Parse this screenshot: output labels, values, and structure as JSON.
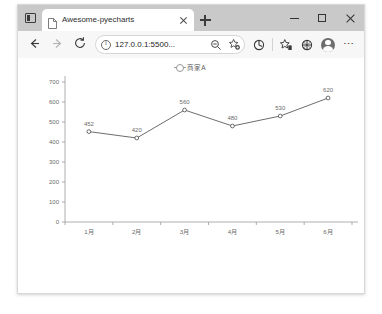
{
  "window": {
    "controls": {
      "minimize_label": "Minimize",
      "maximize_label": "Maximize",
      "close_label": "Close"
    }
  },
  "tabstrip": {
    "tab_search_label": "Tab actions",
    "tabs": [
      {
        "title": "Awesome-pyecharts",
        "close_label": "Close tab"
      }
    ],
    "new_tab_label": "New tab"
  },
  "toolbar": {
    "back_label": "Back",
    "forward_label": "Forward",
    "refresh_label": "Refresh",
    "address": {
      "value": "127.0.0.1:5500...",
      "placeholder": "Search or enter web address",
      "info_label": "View site information",
      "zoom_label": "Zoom",
      "favorite_label": "Add this page to favorites"
    },
    "icons": [
      {
        "name": "collections-icon",
        "label": "Collections"
      },
      {
        "name": "favorites-icon",
        "label": "Favorites"
      },
      {
        "name": "extensions-icon",
        "label": "Extensions"
      },
      {
        "name": "profile-icon",
        "label": "Profile"
      },
      {
        "name": "settings-more-icon",
        "label": "Settings and more"
      }
    ]
  },
  "chart_data": {
    "type": "line",
    "title": "",
    "subtitle": "",
    "xlabel": "",
    "ylabel": "",
    "categories": [
      "1月",
      "2月",
      "3月",
      "4月",
      "5月",
      "6月"
    ],
    "series": [
      {
        "name": "商家A",
        "values": [
          452,
          420,
          560,
          480,
          530,
          620
        ],
        "color": "#5b5b5b",
        "symbol": "circle",
        "show_labels": true
      }
    ],
    "ylim": [
      0,
      700
    ],
    "yticks": [
      0,
      100,
      200,
      300,
      400,
      500,
      600,
      700
    ],
    "ytick_labels": [
      "0",
      "100",
      "200",
      "300",
      "400",
      "500",
      "600",
      "700"
    ],
    "grid": false,
    "legend": {
      "position": "top-center",
      "entries": [
        "商家A"
      ]
    },
    "axis_color": "#9a9a9a",
    "label_color": "#6b6b6b"
  }
}
